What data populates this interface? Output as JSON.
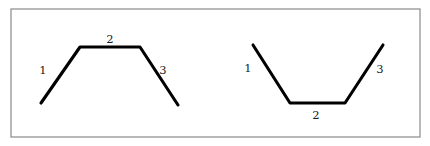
{
  "figure": {
    "canvas": {
      "width": 430,
      "height": 146,
      "background_color": "#ffffff"
    },
    "frame": {
      "name": "outer-border",
      "x": 11,
      "y": 9,
      "width": 409,
      "height": 128,
      "stroke_color": "#8a8a8a",
      "stroke_width": 1.2,
      "fill_color": "#ffffff"
    },
    "stroke_color": "#000000",
    "stroke_width": 3.1,
    "label_color": "#1a1a1a",
    "shapes": [
      {
        "id": "left-shape",
        "name": "plateau-polyline",
        "description": "rising segment, flat top, falling segment",
        "points": "41,103 80,47 140,47 178,105",
        "vertices": [
          {
            "x": 41,
            "y": 103
          },
          {
            "x": 80,
            "y": 47
          },
          {
            "x": 140,
            "y": 47
          },
          {
            "x": 178,
            "y": 105
          }
        ],
        "labels": [
          {
            "id": "left-label-1",
            "text": "1",
            "x": 43,
            "y": 71
          },
          {
            "id": "left-label-2",
            "text": "2",
            "x": 110,
            "y": 40
          },
          {
            "id": "left-label-3",
            "text": "3",
            "x": 163,
            "y": 71
          }
        ]
      },
      {
        "id": "right-shape",
        "name": "valley-polyline",
        "description": "falling segment, flat bottom, rising segment",
        "points": "253,45 290,103 345,103 383,45",
        "vertices": [
          {
            "x": 253,
            "y": 45
          },
          {
            "x": 290,
            "y": 103
          },
          {
            "x": 345,
            "y": 103
          },
          {
            "x": 383,
            "y": 45
          }
        ],
        "labels": [
          {
            "id": "right-label-1",
            "text": "1",
            "x": 248,
            "y": 69
          },
          {
            "id": "right-label-2",
            "text": "2",
            "x": 316,
            "y": 116
          },
          {
            "id": "right-label-3",
            "text": "3",
            "x": 380,
            "y": 70
          }
        ]
      }
    ]
  }
}
